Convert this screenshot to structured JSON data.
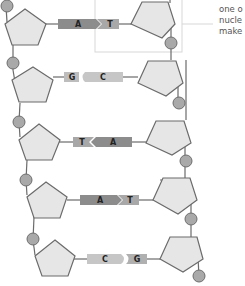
{
  "diagram": {
    "colors": {
      "sugar_fill": "#e6e6e6",
      "sugar_stroke": "#6b6b6b",
      "phosphate_fill": "#a9a9a9",
      "phosphate_stroke": "#6e6e6e",
      "backbone_line": "#6b6b6b",
      "base_A": "#8c8c8c",
      "base_T": "#a8a8a8",
      "base_G": "#bdbdbd",
      "base_C": "#c6c6c6",
      "highlight_box": "#d7d7d7",
      "label_text": "#555555"
    },
    "callout": {
      "lines": [
        "one o",
        "nucle",
        "make"
      ],
      "full_text_hint": "one of the nucleotides that make up DNA (truncated)"
    },
    "base_pairs": [
      {
        "left": "A",
        "right": "T"
      },
      {
        "left": "G",
        "right": "C"
      },
      {
        "left": "T",
        "right": "A"
      },
      {
        "left": "A",
        "right": "T"
      },
      {
        "left": "C",
        "right": "G"
      }
    ],
    "components": {
      "sugar": "pentagon (deoxyribose)",
      "phosphate": "circle",
      "bases": [
        "A",
        "T",
        "G",
        "C"
      ]
    }
  }
}
